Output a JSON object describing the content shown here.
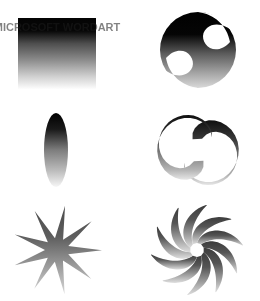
{
  "canvas": {
    "width": 260,
    "height": 301,
    "background_color": "#ffffff",
    "title": "Gradient Shapes Sampler"
  },
  "palette": {
    "gradient_dark": "#050505",
    "gradient_mid": "#7a7a7a",
    "gradient_light": "#ffffff",
    "star_dark": "#4a4a4a",
    "star_light": "#d8d8d8",
    "pinwheel_dark": "#3d3d3d",
    "pinwheel_light": "#e2e2e2"
  },
  "layout": {
    "columns": 2,
    "rows": 3,
    "cell_width": 130,
    "cell_height": 100
  },
  "shapes": [
    {
      "id": "gradient-square",
      "name": "Gradient Square",
      "type": "rectangle",
      "row": 1,
      "column": 1,
      "cx": 57,
      "cy": 53,
      "x": 18,
      "y": 18,
      "width": 78,
      "height": 71,
      "fill": "linear-gradient-vertical",
      "gradient_direction": "top-to-bottom",
      "gradient_from": "#040404",
      "gradient_to": "#ffffff",
      "overlay_text": "MICROSOFT WORDART"
    },
    {
      "id": "clawed-disc",
      "name": "Clawed Disc",
      "type": "circle-with-crescent-cutouts",
      "row": 1,
      "column": 2,
      "cx": 198,
      "cy": 50,
      "radius": 38,
      "cutouts": 2,
      "symmetry": "180-degree rotational",
      "fill": "linear-gradient-vertical",
      "gradient_from": "#000000",
      "gradient_to": "#ffffff"
    },
    {
      "id": "gradient-ellipse",
      "name": "Gradient Ellipse",
      "type": "ellipse",
      "row": 2,
      "column": 1,
      "cx": 56,
      "cy": 150,
      "rx": 12,
      "ry": 37,
      "fill": "linear-gradient-vertical",
      "gradient_from": "#000000",
      "gradient_to": "#ffffff"
    },
    {
      "id": "s-swoosh",
      "name": "S Swoosh",
      "type": "double-hook-swoosh",
      "row": 2,
      "column": 2,
      "cx": 198,
      "cy": 150,
      "radius": 40,
      "symmetry": "180-degree rotational",
      "fill": "linear-gradient-vertical",
      "gradient_from": "#151515",
      "gradient_to": "#e8e8e8"
    },
    {
      "id": "nine-point-star",
      "name": "Nine Point Star Burst",
      "type": "star",
      "row": 3,
      "column": 1,
      "cx": 57,
      "cy": 250,
      "points": 9,
      "outer_radius": 45,
      "inner_radius": 12,
      "fill": "linear-gradient-vertical",
      "gradient_from": "#4a4a4a",
      "gradient_to": "#d4d4d4"
    },
    {
      "id": "spiral-pinwheel",
      "name": "Spiral Pinwheel",
      "type": "pinwheel",
      "row": 3,
      "column": 2,
      "cx": 197,
      "cy": 250,
      "blades": 10,
      "outer_radius": 46,
      "inner_radius": 7,
      "rotation_direction": "counter-clockwise",
      "fill": "linear-gradient-vertical",
      "gradient_from": "#3a3a3a",
      "gradient_to": "#dcdcdc"
    }
  ]
}
